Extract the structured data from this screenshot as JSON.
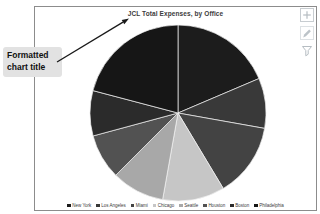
{
  "callout": {
    "label": "Formatted\nchart title"
  },
  "chart": {
    "title": "JCL Total Expenses, by Office",
    "frame_border_color": "#8c8c8c"
  },
  "toolbar": {
    "icons": [
      {
        "name": "add-icon"
      },
      {
        "name": "pencil-icon"
      },
      {
        "name": "filter-icon"
      }
    ],
    "icon_color": "#b6bdc2"
  },
  "chart_data": {
    "type": "pie",
    "title": "JCL Total Expenses, by Office",
    "labels": [
      "New York",
      "Los Angeles",
      "Miami",
      "Chicago",
      "Seattle",
      "Houston",
      "Boston",
      "Philadelphia"
    ],
    "values": [
      18.6,
      9.2,
      13.6,
      11.4,
      9.7,
      8.3,
      8.3,
      20.9
    ],
    "value_type": "percent_of_total_estimated_from_slice_angles",
    "colors": [
      "#1c1c1c",
      "#393939",
      "#434343",
      "#c6c6c6",
      "#a8a8a8",
      "#525252",
      "#2b2b2b",
      "#161616"
    ],
    "start_angle_deg": 0,
    "direction": "clockwise",
    "legend_position": "bottom",
    "slice_border_color": "#f2f2f2",
    "data_labels_shown": false
  }
}
